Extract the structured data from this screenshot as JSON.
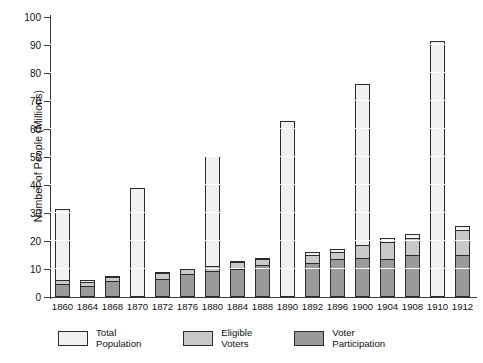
{
  "chart_data": {
    "type": "bar",
    "stacked": true,
    "title": "",
    "xlabel": "",
    "ylabel": "Number of People (Millions)",
    "ylim": [
      0,
      100
    ],
    "ytick_labels": [
      "0",
      "10",
      "20",
      "30",
      "40",
      "50",
      "60",
      "70",
      "80",
      "90",
      "100"
    ],
    "ytick_values": [
      0,
      10,
      20,
      30,
      40,
      50,
      60,
      70,
      80,
      90,
      100
    ],
    "grid": "horizontal-white",
    "legend_position": "bottom",
    "categories": [
      "1860",
      "1864",
      "1868",
      "1870",
      "1872",
      "1876",
      "1880",
      "1884",
      "1888",
      "1890",
      "1892",
      "1896",
      "1900",
      "1904",
      "1908",
      "1910",
      "1912"
    ],
    "series": [
      {
        "name": "Total Population",
        "color": "#f1f1f1",
        "values": [
          31.5,
          6,
          7.5,
          39,
          9,
          10.5,
          50.5,
          13,
          14,
          63,
          16,
          17,
          76,
          21,
          22.5,
          91.5,
          25.5
        ]
      },
      {
        "name": "Eligible Voters",
        "color": "#c9c9c9",
        "values": [
          6,
          5.5,
          7,
          0,
          8.5,
          10,
          11,
          12.5,
          13.5,
          0,
          15,
          16,
          18.5,
          19.5,
          21,
          0,
          24
        ]
      },
      {
        "name": "Voter Participation",
        "color": "#9a9a9a",
        "values": [
          4.7,
          4.1,
          5.7,
          0,
          6.5,
          8.2,
          9.2,
          10.1,
          11.4,
          0,
          12,
          13.6,
          13.9,
          13.5,
          14.9,
          0,
          15.1
        ]
      }
    ]
  },
  "legend": {
    "items": [
      {
        "label": "Total\nPopulation",
        "swatch": "sw-total"
      },
      {
        "label": "Eligible\nVoters",
        "swatch": "sw-elig"
      },
      {
        "label": "Voter\nParticipation",
        "swatch": "sw-part"
      }
    ]
  }
}
